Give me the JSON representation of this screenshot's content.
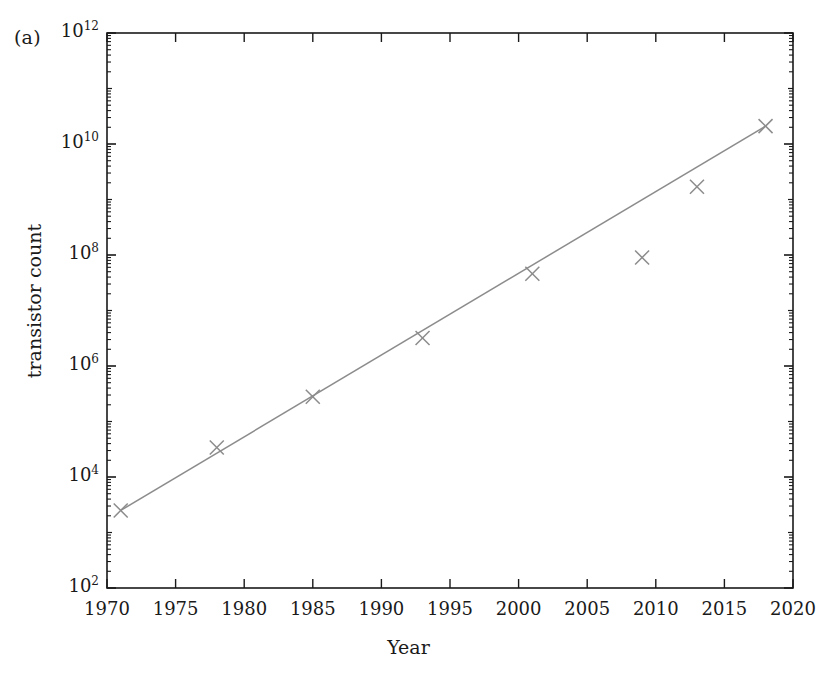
{
  "figure": {
    "panel_label": "(a)",
    "background_color": "#ffffff",
    "axis_color": "#1a1a1a",
    "data_color": "#8c8c8c"
  },
  "chart_data": {
    "type": "scatter",
    "title": "",
    "subtitle": "",
    "panel": "(a)",
    "xlabel": "Year",
    "ylabel": "transistor count",
    "xlim": [
      1970,
      2020
    ],
    "ylim": [
      100,
      1000000000000
    ],
    "yscale": "log",
    "xscale": "linear",
    "grid": false,
    "legend": null,
    "legend_position": "none",
    "xticks": [
      1970,
      1975,
      1980,
      1985,
      1990,
      1995,
      2000,
      2005,
      2010,
      2015,
      2020
    ],
    "xtick_labels": [
      "1970",
      "1975",
      "1980",
      "1985",
      "1990",
      "1995",
      "2000",
      "2005",
      "2010",
      "2015",
      "2020"
    ],
    "yticks": [
      100,
      10000,
      1000000,
      100000000,
      10000000000,
      1000000000000
    ],
    "ytick_labels": [
      "10^2",
      "10^4",
      "10^6",
      "10^8",
      "10^10",
      "10^12"
    ],
    "ytick_mantissas": [
      "10",
      "10",
      "10",
      "10",
      "10",
      "10"
    ],
    "ytick_exponents": [
      "2",
      "4",
      "6",
      "8",
      "10",
      "12"
    ],
    "minor_ticks": "log decades",
    "marker": "x",
    "x": [
      1971,
      1978,
      1985,
      1993,
      2001,
      2009,
      2013,
      2018
    ],
    "y": [
      2500,
      34000,
      280000,
      3200000,
      46000000,
      90000000,
      1700000000,
      21000000000
    ],
    "series": [
      {
        "name": "transistor count",
        "marker": "x",
        "color": "#8c8c8c",
        "points": [
          {
            "x": 1971,
            "y": 2500
          },
          {
            "x": 1978,
            "y": 34000
          },
          {
            "x": 1985,
            "y": 280000
          },
          {
            "x": 1993,
            "y": 3200000
          },
          {
            "x": 2001,
            "y": 46000000
          },
          {
            "x": 2009,
            "y": 90000000
          },
          {
            "x": 2013,
            "y": 1700000000
          },
          {
            "x": 2018,
            "y": 21000000000
          }
        ]
      },
      {
        "name": "fit line",
        "type": "line",
        "color": "#8c8c8c",
        "endpoints": [
          {
            "x": 1971,
            "y": 2500
          },
          {
            "x": 2018,
            "y": 21000000000
          }
        ]
      }
    ],
    "annotations": [
      {
        "text": "(a)",
        "position": "top-left-outside"
      }
    ]
  }
}
